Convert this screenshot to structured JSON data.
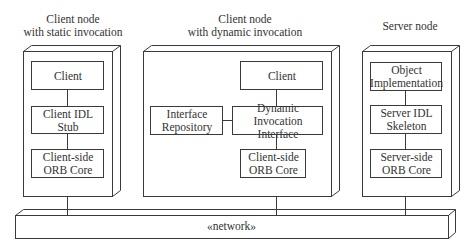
{
  "nodes": [
    {
      "title_line1": "Client node",
      "title_line2": "with static invocation",
      "components": [
        {
          "line1": "Client",
          "line2": ""
        },
        {
          "line1": "Client IDL Stub",
          "line2": ""
        },
        {
          "line1": "Client-side",
          "line2": "ORB Core"
        }
      ]
    },
    {
      "title_line1": "Client node",
      "title_line2": "with dynamic invocation",
      "components": [
        {
          "line1": "Client",
          "line2": ""
        },
        {
          "line1": "Interface",
          "line2": "Repository"
        },
        {
          "line1": "Dynamic Invocation",
          "line2": "Interface"
        },
        {
          "line1": "Client-side",
          "line2": "ORB Core"
        }
      ]
    },
    {
      "title_line1": "Server node",
      "title_line2": "",
      "components": [
        {
          "line1": "Object",
          "line2": "Implementation"
        },
        {
          "line1": "Server IDL",
          "line2": "Skeleton"
        },
        {
          "line1": "Server-side",
          "line2": "ORB Core"
        }
      ]
    }
  ],
  "network": {
    "label": "«network»"
  },
  "colors": {
    "stroke": "#3a3a3a",
    "background": "#ffffff"
  }
}
